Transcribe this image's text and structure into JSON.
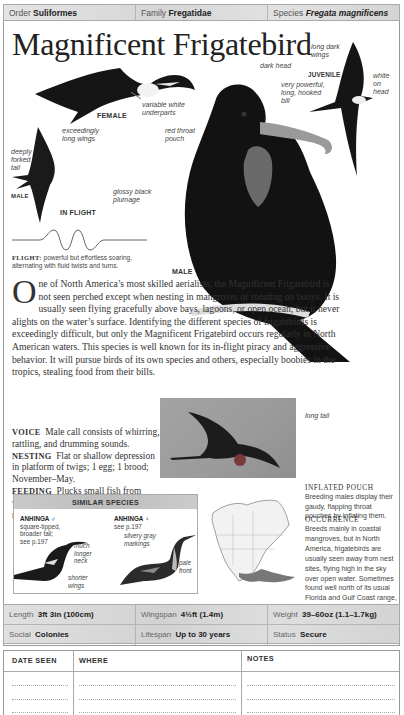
{
  "header": {
    "order_label": "Order",
    "order_value": "Suliformes",
    "family_label": "Family",
    "family_value": "Fregatidae",
    "species_label": "Species",
    "species_value": "Fregata magnificens"
  },
  "title": "Magnificent Frigatebird",
  "illustrations": {
    "female": {
      "caption": "FEMALE",
      "labels": [
        "variable white",
        "underparts"
      ]
    },
    "in_flight_male": {
      "caption": "IN FLIGHT",
      "sex": "MALE",
      "labels": {
        "wings": [
          "exceedingly",
          "long wings"
        ],
        "tail": [
          "deeply",
          "forked",
          "tail"
        ]
      }
    },
    "male_perched": {
      "caption": "MALE",
      "labels": {
        "head": "dark head",
        "bill": [
          "very powerful,",
          "long, hooked",
          "bill"
        ],
        "pouch": [
          "red throat",
          "pouch"
        ],
        "plumage": [
          "glossy black",
          "plumage"
        ],
        "tail": "long tail"
      }
    },
    "juvenile": {
      "caption": "JUVENILE",
      "labels": {
        "wings": [
          "long dark",
          "wings"
        ],
        "head": [
          "white",
          "on",
          "head"
        ]
      }
    }
  },
  "flight": {
    "label": "FLIGHT:",
    "text": "powerful but effortless soaring, alternating with fluid twists and turns."
  },
  "description": {
    "dropcap": "O",
    "text": "ne of North America’s most skilled aerialists, the Magnificent Frigatebird is not seen perched except when nesting in mangroves or roosting on buoys. It is usually seen flying gracefully above bays, lagoons, or open ocean, but it never alights on the water’s surface. Identifying the different species of frigatebirds is exceedingly difficult, but only the Magnificent Frigatebird occurs regularly in North American waters. This species is well known for its in-flight piracy and aggressive behavior. It will pursue birds of its own species and others, especially boobies in the tropics, stealing food from their bills."
  },
  "facts": [
    {
      "label": "VOICE",
      "text": "Male call consists of whirring, rattling, and drumming sounds."
    },
    {
      "label": "NESTING",
      "text": "Flat or shallow depression in platform of twigs; 1 egg; 1 brood; November–May."
    },
    {
      "label": "FEEDING",
      "text": "Plucks small fish from water’s surface, never wetting itself; regularly steals food from other birds."
    }
  ],
  "inflated_pouch": {
    "heading": "INFLATED POUCH",
    "text": "Breeding males display their gaudy, flapping throat pouches by inflating them."
  },
  "occurrence": {
    "heading": "OCCURRENCE",
    "text": "Breeds mainly in coastal mangroves, but in North America, frigatebirds are usually seen away from nest sites, flying high in the sky over open water. Sometimes found well north of its usual Florida and Gulf Coast range, especially after hurricanes, and a few wander inland every year."
  },
  "similar_species": {
    "title": "SIMILAR SPECIES",
    "species": [
      {
        "name": "ANHINGA ♂",
        "notes": [
          "square-tipped,",
          "broader tail;",
          "see p.197"
        ],
        "labels": [
          [
            "much",
            "longer",
            "neck"
          ],
          [
            "shorter",
            "wings"
          ]
        ]
      },
      {
        "name": "ANHINGA ♀",
        "notes": [
          "see p.197"
        ],
        "labels": [
          [
            "silvery gray",
            "markings"
          ],
          [
            "pale",
            "front"
          ]
        ]
      }
    ]
  },
  "stats": [
    [
      {
        "label": "Length",
        "value": "3ft 3in (100cm)"
      },
      {
        "label": "Wingspan",
        "value": "4½ft (1.4m)"
      },
      {
        "label": "Weight",
        "value": "39–60oz (1.1–1.7kg)"
      }
    ],
    [
      {
        "label": "Social",
        "value": "Colonies"
      },
      {
        "label": "Lifespan",
        "value": "Up to 30 years"
      },
      {
        "label": "Status",
        "value": "Secure"
      }
    ]
  ],
  "log": {
    "columns": [
      "DATE SEEN",
      "WHERE",
      "NOTES"
    ],
    "rows": 3
  },
  "colors": {
    "header_bg": "#d9d9d9",
    "bird_black": "#151515",
    "photo_bg": "#9c9c9c",
    "range_shade": "#777777"
  }
}
